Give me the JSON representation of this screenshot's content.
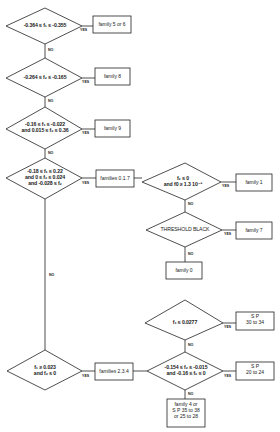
{
  "diagram": {
    "type": "decision-flowchart",
    "decisions": [
      {
        "id": "d1",
        "lines": [
          "-0.364 ≤ f₁ ≤ -0.355"
        ]
      },
      {
        "id": "d2",
        "lines": [
          "-0.264 ≤ f₂ ≤ -0.165"
        ]
      },
      {
        "id": "d3",
        "lines": [
          "-0.16 ≤ f₁ ≤ -0.022",
          "and 0.015 ≤ f₂ ≤ 0.36"
        ]
      },
      {
        "id": "d4",
        "lines": [
          "-0.18 ≤ f₁ ≤ 0.22",
          "and 0 ≤ f₂ ≤ 0.024",
          "and -0.028 ≤ f₂"
        ]
      },
      {
        "id": "d5",
        "lines": [
          "f₂ ≤ 0",
          "and f0 ≥ 1.3 10⁻³"
        ]
      },
      {
        "id": "d6",
        "lines": [
          "THRESHOLD BLACK"
        ]
      },
      {
        "id": "d7",
        "lines": [
          "f₁ ≥ 0.023",
          "and f₂ ≤ 0"
        ]
      },
      {
        "id": "d8",
        "lines": [
          "f₁ ≤ 0.0277"
        ]
      },
      {
        "id": "d9",
        "lines": [
          "-0.154 ≤ f₂ ≤ -0.015",
          "and -0.16 ≤ f₂ ≤ 0"
        ]
      }
    ],
    "results": [
      {
        "id": "r1",
        "lines": [
          "family 5 or 6"
        ]
      },
      {
        "id": "r2",
        "lines": [
          "family  8"
        ]
      },
      {
        "id": "r3",
        "lines": [
          "family  9"
        ]
      },
      {
        "id": "r4",
        "lines": [
          "families 0.1.7"
        ]
      },
      {
        "id": "r5",
        "lines": [
          "family  1"
        ]
      },
      {
        "id": "r6",
        "lines": [
          "family  7"
        ]
      },
      {
        "id": "r7",
        "lines": [
          "family  0"
        ]
      },
      {
        "id": "r8",
        "lines": [
          "families 2.3.4"
        ]
      },
      {
        "id": "r9",
        "lines": [
          "S  P",
          "30 to 34"
        ]
      },
      {
        "id": "r10",
        "lines": [
          "S  P",
          "20 to 24"
        ]
      },
      {
        "id": "r11",
        "lines": [
          "family 4  or",
          "S P  35 to 38",
          "or 25 to 28"
        ]
      }
    ],
    "edge_labels": {
      "yes": "YES",
      "no": "NO"
    }
  }
}
